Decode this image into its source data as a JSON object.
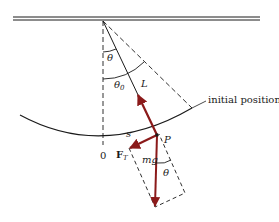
{
  "diagram": {
    "type": "simple pendulum force diagram",
    "colors": {
      "line": "#1a1a1a",
      "vector": "#8b1a1a",
      "background": "#ffffff"
    },
    "labels": {
      "theta_top": "θ",
      "theta0": "θ",
      "theta0_sub": "0",
      "length": "L",
      "initial_position": "initial position",
      "arc_length": "s",
      "origin": "0",
      "point": "P",
      "tension_force": "F",
      "tension_sub": "T",
      "weight": "mg",
      "theta_bottom": "θ"
    }
  }
}
